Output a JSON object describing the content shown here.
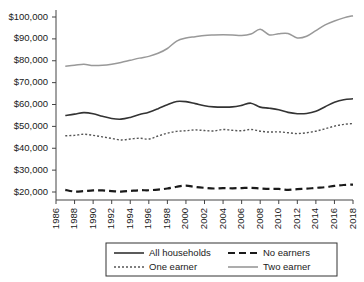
{
  "chart_data": {
    "type": "line",
    "title": "",
    "subtitle": "",
    "xlabel": "",
    "ylabel": "",
    "xlim": [
      1986,
      2018
    ],
    "ylim": [
      20000,
      100000
    ],
    "grid": false,
    "legend_position": "bottom",
    "y_tick_labels": [
      "$100,000",
      "$90,000",
      "$80,000",
      "$70,000",
      "$60,000",
      "$50,000",
      "$40,000",
      "$30,000",
      "$20,000"
    ],
    "y_tick_values": [
      100000,
      90000,
      80000,
      70000,
      60000,
      50000,
      40000,
      30000,
      20000
    ],
    "x_tick_labels": [
      "1986",
      "1988",
      "1990",
      "1992",
      "1994",
      "1996",
      "1998",
      "2000",
      "2002",
      "2004",
      "2006",
      "2008",
      "2010",
      "2012",
      "2014",
      "2016",
      "2018"
    ],
    "x_tick_values": [
      1986,
      1988,
      1990,
      1992,
      1994,
      1996,
      1998,
      2000,
      2002,
      2004,
      2006,
      2008,
      2010,
      2012,
      2014,
      2016,
      2018
    ],
    "x": [
      1987,
      1988,
      1989,
      1990,
      1991,
      1992,
      1993,
      1994,
      1995,
      1996,
      1997,
      1998,
      1999,
      2000,
      2001,
      2002,
      2003,
      2004,
      2005,
      2006,
      2007,
      2008,
      2009,
      2010,
      2011,
      2012,
      2013,
      2014,
      2015,
      2016,
      2017,
      2018
    ],
    "series": [
      {
        "name": "All households",
        "style": "solid",
        "color": "#333333",
        "width": 1.6,
        "values": [
          55000,
          55600,
          56300,
          55800,
          54600,
          53600,
          53300,
          54100,
          55400,
          56500,
          58100,
          59900,
          61400,
          61300,
          60400,
          59400,
          58900,
          58800,
          58900,
          59600,
          60600,
          58800,
          58300,
          57600,
          56400,
          55800,
          55900,
          56900,
          59000,
          61000,
          62200,
          62600
        ]
      },
      {
        "name": "No earners",
        "style": "dashed",
        "color": "#1a1a1a",
        "width": 2.2,
        "values": [
          21000,
          20200,
          20400,
          20700,
          20700,
          20400,
          20200,
          20500,
          20800,
          20800,
          21100,
          21600,
          22400,
          22900,
          22300,
          21900,
          21600,
          21800,
          21700,
          21800,
          21900,
          21600,
          21400,
          21400,
          21000,
          21300,
          21500,
          21900,
          22200,
          22800,
          23200,
          23400
        ]
      },
      {
        "name": "One earner",
        "style": "dotted",
        "color": "#555555",
        "width": 1.4,
        "values": [
          45700,
          45900,
          46400,
          45900,
          45200,
          44500,
          43800,
          44200,
          44600,
          44200,
          45600,
          46900,
          47700,
          48000,
          48400,
          48100,
          47900,
          48600,
          48200,
          48000,
          48600,
          47800,
          47400,
          47500,
          47100,
          46700,
          47100,
          47800,
          48900,
          50100,
          50900,
          51300
        ]
      },
      {
        "name": "Two earner",
        "style": "solid",
        "color": "#999999",
        "width": 1.5,
        "values": [
          77500,
          77900,
          78400,
          77800,
          77900,
          78400,
          79200,
          80200,
          81200,
          82000,
          83400,
          85600,
          89000,
          90400,
          91000,
          91600,
          91800,
          91900,
          91800,
          91500,
          92200,
          94400,
          91800,
          92400,
          92500,
          90400,
          91200,
          93800,
          96400,
          98200,
          99600,
          100600
        ]
      }
    ],
    "legend": [
      {
        "label": "All households",
        "style": "solid",
        "color": "#333333"
      },
      {
        "label": "No earners",
        "style": "dashed",
        "color": "#1a1a1a"
      },
      {
        "label": "One earner",
        "style": "dotted",
        "color": "#555555"
      },
      {
        "label": "Two earner",
        "style": "solid",
        "color": "#999999"
      }
    ]
  }
}
